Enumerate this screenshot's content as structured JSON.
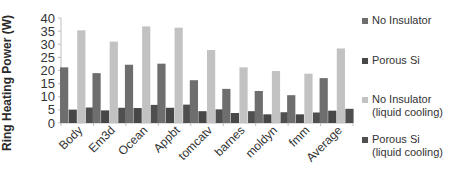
{
  "chart_data": {
    "type": "bar",
    "title": "",
    "xlabel": "",
    "ylabel": "Ring Heating Power (W)",
    "ylim": [
      0,
      40
    ],
    "yticks": [
      0,
      5,
      10,
      15,
      20,
      25,
      30,
      35,
      40
    ],
    "grid": false,
    "legend_position": "right",
    "categories": [
      "Body",
      "Em3d",
      "Ocean",
      "Appbt",
      "tomcatv",
      "barnes",
      "moldyn",
      "fmm",
      "Average"
    ],
    "series": [
      {
        "name": "No Insulator",
        "color": "#6e6e6e",
        "values": [
          21.2,
          19.0,
          22.2,
          22.6,
          16.3,
          13.0,
          12.2,
          10.6,
          17.1
        ]
      },
      {
        "name": "Porous Si",
        "color": "#474747",
        "values": [
          5.1,
          4.8,
          5.7,
          5.8,
          4.5,
          3.8,
          3.3,
          3.3,
          4.7
        ]
      },
      {
        "name": "No Insulator (liquid cooling)",
        "color": "#c2c2c2",
        "values": [
          35.3,
          31.0,
          36.8,
          36.3,
          27.8,
          21.2,
          19.8,
          18.8,
          28.4
        ]
      },
      {
        "name": "Porous Si (liquid cooling)",
        "color": "#4f4f4f",
        "values": [
          5.9,
          5.8,
          6.9,
          7.0,
          5.2,
          4.5,
          4.1,
          4.0,
          5.4
        ]
      }
    ]
  },
  "legend": {
    "items": [
      {
        "label": "No Insulator",
        "color": "#6e6e6e"
      },
      {
        "label": "Porous Si",
        "color": "#474747"
      },
      {
        "label": "No Insulator\n(liquid cooling)",
        "color": "#c2c2c2"
      },
      {
        "label": "Porous Si\n(liquid cooling)",
        "color": "#4f4f4f"
      }
    ]
  }
}
